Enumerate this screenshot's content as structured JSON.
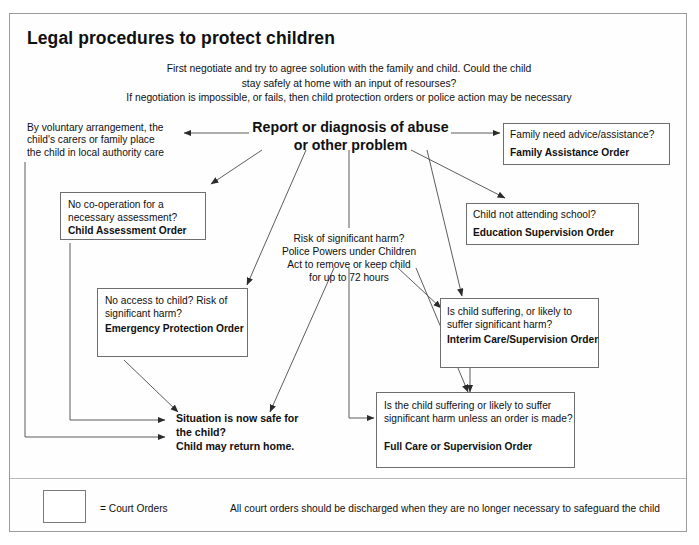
{
  "document": {
    "title": "Legal procedures to protect children",
    "intro_lines": [
      "First negotiate and try to agree solution with the family and child. Could the child",
      "stay safely at home with an input of resourses?",
      "If negotiation is impossible, or fails, then child protection orders or police action may be necessary"
    ],
    "intro_text": "First negotiate and try to agree solution with the family and child. Could the child\nstay safely at home with an input of resourses?\nIf negotiation is impossible, or fails, then child protection orders or police action may be necessary"
  },
  "hub": {
    "label": "Report or diagnosis of abuse\nor other problem",
    "line1": "Report or diagnosis of abuse",
    "line2": "or other problem"
  },
  "nodes": {
    "voluntary": {
      "name": "voluntary-arrangement",
      "boxed": false,
      "body": "By voluntary arrangement, the\nchild's carers or family place\nthe child in local authority care",
      "order": ""
    },
    "child_assessment": {
      "name": "child-assessment-order",
      "boxed": true,
      "body": "No co-operation for a\nnecessary assessment?",
      "order": "Child Assessment Order"
    },
    "family_assistance": {
      "name": "family-assistance-order",
      "boxed": true,
      "body": "Family need advice/assistance?",
      "order": "Family Assistance Order"
    },
    "education_supervision": {
      "name": "education-supervision-order",
      "boxed": true,
      "body": "Child not attending school?",
      "order": "Education Supervision Order"
    },
    "police_powers": {
      "name": "police-powers-72-hours",
      "boxed": false,
      "body": "Risk of significant harm?\nPolice Powers under Children\nAct to remove or keep child\nfor up to 72 hours",
      "order": ""
    },
    "emergency_protection": {
      "name": "emergency-protection-order",
      "boxed": true,
      "body": "No access to child?\nRisk of significant harm?",
      "order": "Emergency Protection\nOrder"
    },
    "interim_care": {
      "name": "interim-care-supervision-order",
      "boxed": true,
      "body": "Is child suffering, or likely to\nsuffer significant harm?",
      "order": "Interim Care/Supervision\nOrder"
    },
    "situation_safe": {
      "name": "situation-now-safe",
      "boxed": false,
      "body": "Situation is now safe for\nthe child?\nChild may return home."
    },
    "full_care": {
      "name": "full-care-supervision-order",
      "boxed": true,
      "body": "Is the child suffering or likely to suffer\nsignificant harm unless an order is\nmade?",
      "order": "Full Care or Supervision Order"
    }
  },
  "legend": {
    "key_label": "= Court Orders",
    "note": "All court orders should be discharged when they are no longer necessary to safeguard the child"
  },
  "colors": {
    "ink": "#101010",
    "box_border": "#6e6e6e",
    "frame_border": "#9a9a9a",
    "connector": "#4a4a4a",
    "page_background": "#ffffff"
  }
}
